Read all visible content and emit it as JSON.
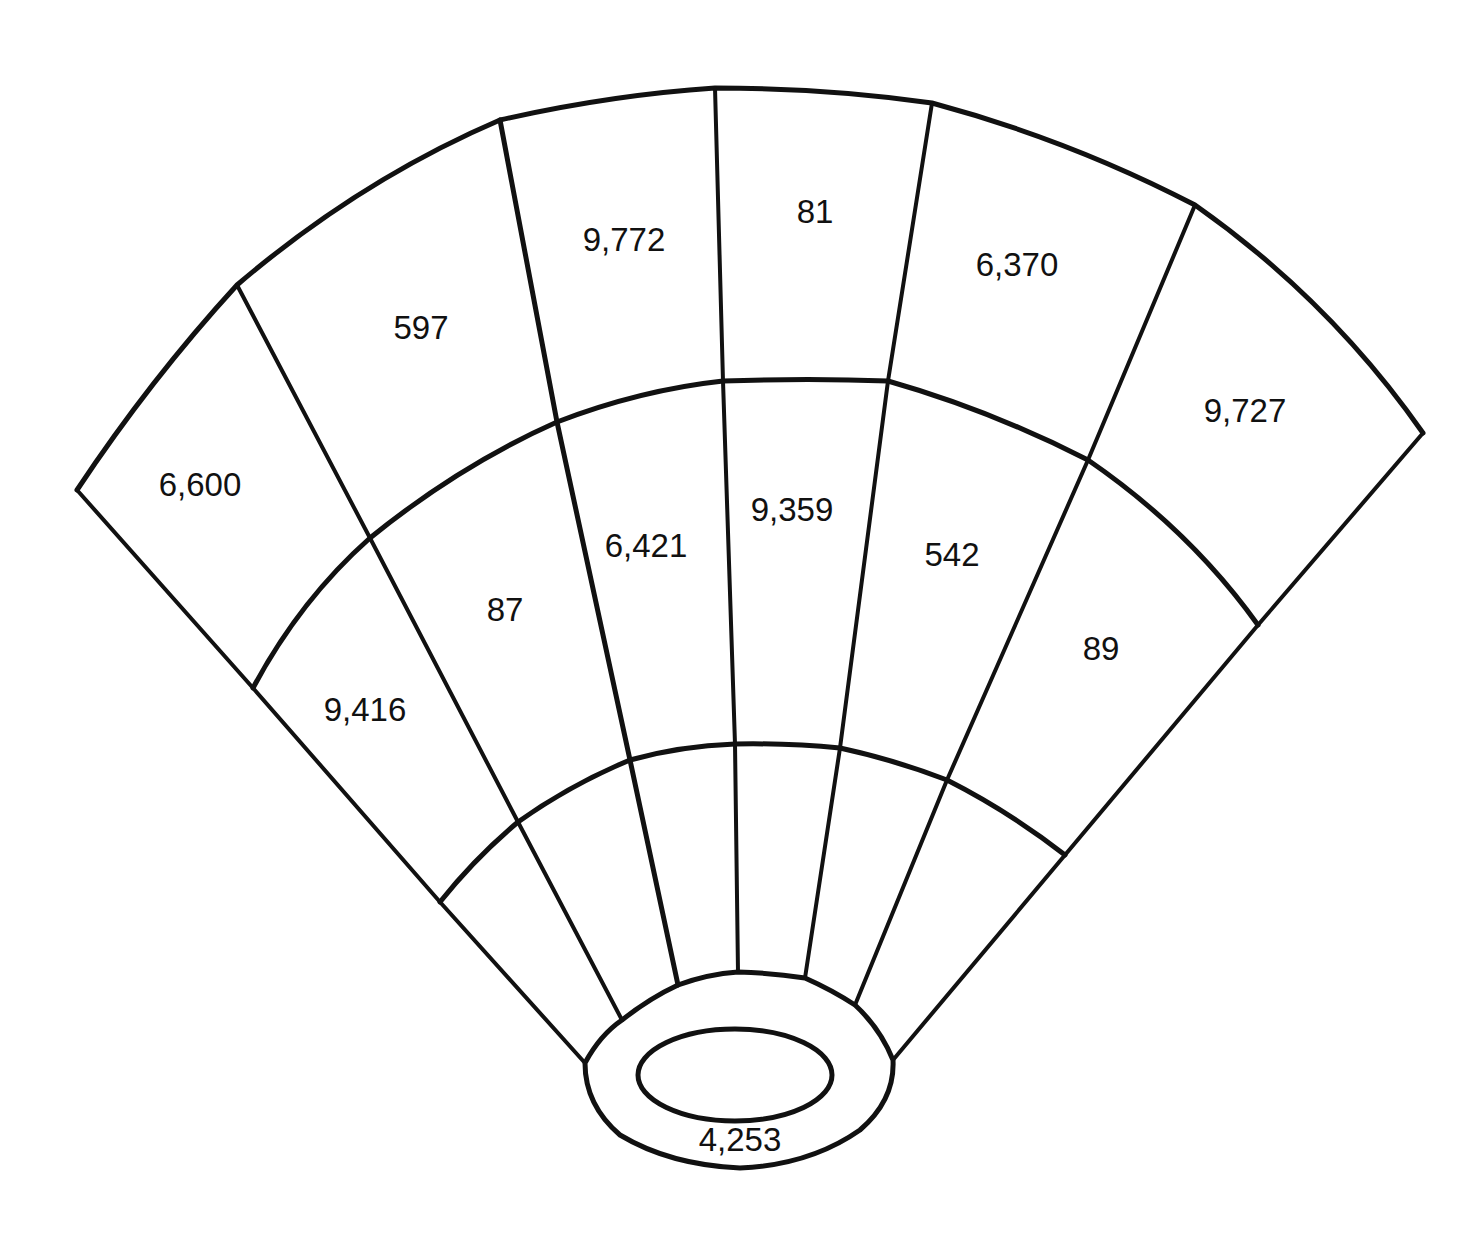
{
  "diagram": {
    "type": "stadium-seating-fan",
    "stroke_color": "#111111",
    "background": "#ffffff",
    "sections": {
      "upper": [
        {
          "id": "U1",
          "label": "6,600",
          "x": 200,
          "y": 487
        },
        {
          "id": "U2",
          "label": "597",
          "x": 421,
          "y": 330
        },
        {
          "id": "U3",
          "label": "9,772",
          "x": 624,
          "y": 242
        },
        {
          "id": "U4",
          "label": "81",
          "x": 815,
          "y": 214
        },
        {
          "id": "U5",
          "label": "6,370",
          "x": 1017,
          "y": 267
        },
        {
          "id": "U6",
          "label": "9,727",
          "x": 1245,
          "y": 413
        }
      ],
      "middle": [
        {
          "id": "M1",
          "label": "9,416",
          "x": 365,
          "y": 712
        },
        {
          "id": "M2",
          "label": "87",
          "x": 505,
          "y": 612
        },
        {
          "id": "M3",
          "label": "6,421",
          "x": 646,
          "y": 548
        },
        {
          "id": "M4",
          "label": "9,359",
          "x": 792,
          "y": 512
        },
        {
          "id": "M5",
          "label": "542",
          "x": 952,
          "y": 557
        },
        {
          "id": "M6",
          "label": "89",
          "x": 1101,
          "y": 651
        }
      ],
      "lower": [
        {
          "id": "L1",
          "label": ""
        },
        {
          "id": "L2",
          "label": ""
        },
        {
          "id": "L3",
          "label": ""
        },
        {
          "id": "L4",
          "label": ""
        },
        {
          "id": "L5",
          "label": ""
        },
        {
          "id": "L6",
          "label": ""
        }
      ],
      "field": {
        "id": "F",
        "label": "4,253",
        "x": 740,
        "y": 1142
      }
    }
  }
}
